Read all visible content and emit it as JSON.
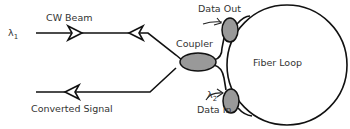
{
  "diagram": {
    "type": "fiber-loop-wavelength-converter-schematic",
    "labels": {
      "lambda1": "λ",
      "lambda1_sub": "1",
      "cw_beam": "CW Beam",
      "coupler": "Coupler",
      "data_out": "Data Out",
      "fiber_loop": "Fiber Loop",
      "lambda2": "λ",
      "lambda2_sub": "2",
      "data_in": "Data In",
      "converted_signal": "Converted Signal"
    },
    "components": [
      {
        "id": "main-coupler",
        "label": "Coupler",
        "shape": "ellipse"
      },
      {
        "id": "data-out-coupler",
        "label": "Data Out",
        "shape": "ellipse"
      },
      {
        "id": "data-in-coupler",
        "label": "Data In",
        "shape": "ellipse"
      },
      {
        "id": "fiber-loop",
        "label": "Fiber Loop",
        "shape": "circle"
      }
    ],
    "connections": [
      {
        "from": "λ1 input",
        "to": "main-coupler",
        "label": "CW Beam",
        "direction": "rightward"
      },
      {
        "from": "main-coupler",
        "to": "output",
        "label": "Converted Signal",
        "direction": "leftward"
      },
      {
        "from": "main-coupler",
        "to": "data-out-coupler"
      },
      {
        "from": "main-coupler",
        "to": "data-in-coupler"
      },
      {
        "from": "data-out-coupler",
        "to": "fiber-loop"
      },
      {
        "from": "data-in-coupler",
        "to": "fiber-loop"
      }
    ],
    "colors": {
      "line": "#111111",
      "coupler_fill": "#999999",
      "text": "#333333",
      "background": "#ffffff"
    }
  }
}
